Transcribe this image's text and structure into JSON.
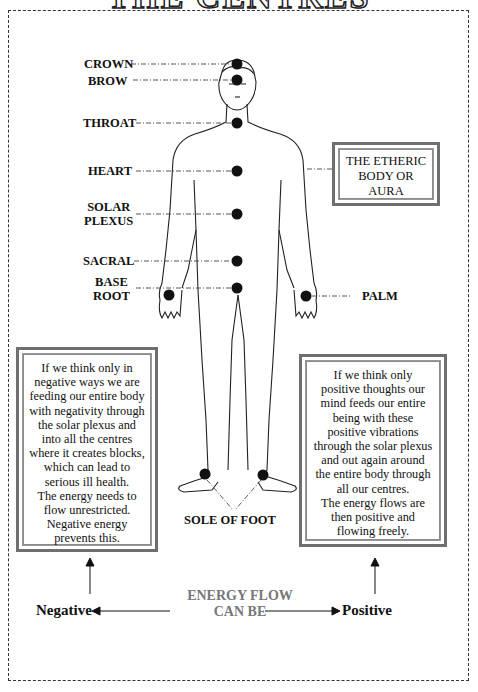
{
  "title": "THE CENTRES",
  "centres": [
    {
      "label": "CROWN"
    },
    {
      "label": "BROW"
    },
    {
      "label": "THROAT"
    },
    {
      "label": "HEART"
    },
    {
      "label": "SOLAR\nPLEXUS",
      "line1": "SOLAR",
      "line2": "PLEXUS"
    },
    {
      "label": "SACRAL"
    },
    {
      "label": "BASE ROOT",
      "line1": "BASE",
      "line2": "ROOT"
    },
    {
      "label": "PALM"
    },
    {
      "label": "SOLE OF FOOT"
    }
  ],
  "aura_box": {
    "line1": "THE ETHERIC",
    "line2": "BODY OR",
    "line3": "AURA"
  },
  "negative_box": {
    "lines": [
      "If we think only in",
      "negative ways we are",
      "feeding our entire body",
      "with negativity through",
      "the solar plexus and",
      "into all the centres",
      "where it creates blocks,",
      "which can lead to",
      "serious ill health.",
      "The energy needs to",
      "flow unrestricted.",
      "Negative energy",
      "prevents this."
    ]
  },
  "positive_box": {
    "lines": [
      "If we think only",
      "positive thoughts our",
      "mind feeds our entire",
      "being with these",
      "positive vibrations",
      "through the solar plexus",
      "and out again around",
      "the entire body through",
      "all our centres.",
      "The energy flows are",
      "then positive and",
      "flowing freely."
    ]
  },
  "energy_flow": {
    "title_line1": "ENERGY FLOW",
    "title_line2": "CAN BE",
    "negative": "Negative",
    "positive": "Positive"
  },
  "colors": {
    "ink": "#111111",
    "box_frame": "#6f6f6f",
    "flow_title": "#777777",
    "chakra": "#111111"
  }
}
